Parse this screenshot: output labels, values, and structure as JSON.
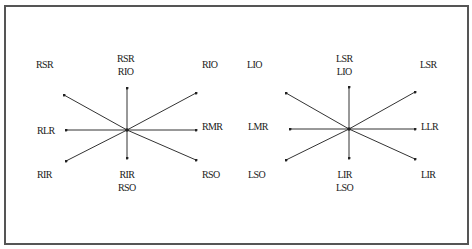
{
  "diagrams": [
    {
      "name": "right-eye",
      "center": [
        127,
        130
      ],
      "labels": {
        "top_left": "RSR",
        "top_center": [
          "RSR",
          "RIO"
        ],
        "top_right": "RIO",
        "middle_left": "RLR",
        "middle_right": "RMR",
        "bottom_left": "RIR",
        "bottom_center": [
          "RIR",
          "RSO"
        ],
        "bottom_right": "RSO"
      }
    },
    {
      "name": "left-eye",
      "center": [
        349,
        129
      ],
      "labels": {
        "top_left": "LIO",
        "top_center": [
          "LSR",
          "LIO"
        ],
        "top_right": "LSR",
        "middle_left": "LMR",
        "middle_right": "LLR",
        "bottom_left": "LSO",
        "bottom_center": [
          "LIR",
          "LSO"
        ],
        "bottom_right": "LIR"
      }
    }
  ],
  "colors": {
    "line": "#333333",
    "border": "#555555",
    "text": "#1a1a1a"
  }
}
